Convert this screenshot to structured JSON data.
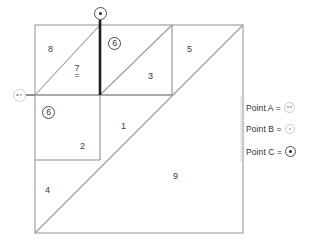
{
  "figure": {
    "colors": {
      "thin_line": "#9a9a9a",
      "mid_line": "#8f8f8f",
      "thick_line": "#1f1f1f",
      "text": "#333333",
      "background": "#ffffff"
    },
    "regions": [
      {
        "id": "r1",
        "label": "1",
        "x": 121,
        "y": 122,
        "circled": false
      },
      {
        "id": "r2",
        "label": "2",
        "x": 80,
        "y": 142,
        "circled": false
      },
      {
        "id": "r3",
        "label": "3",
        "x": 148,
        "y": 72,
        "circled": false
      },
      {
        "id": "r4",
        "label": "4",
        "x": 45,
        "y": 186,
        "circled": false
      },
      {
        "id": "r5",
        "label": "5",
        "x": 187,
        "y": 45,
        "circled": false
      },
      {
        "id": "r6left",
        "label": "6",
        "x": 48,
        "y": 112,
        "circled": true
      },
      {
        "id": "r6top",
        "label": "6",
        "x": 114,
        "y": 43,
        "circled": true
      },
      {
        "id": "r8",
        "label": "8",
        "x": 48,
        "y": 45,
        "circled": false
      },
      {
        "id": "r9",
        "label": "9",
        "x": 173,
        "y": 172,
        "circled": false
      }
    ],
    "region7": {
      "label": "7",
      "equals_mark": "=",
      "x": 76,
      "y": 68
    },
    "points": [
      {
        "id": "pointA",
        "name": "Point A",
        "x": 19,
        "y": 96,
        "symbol": "circle-two-dots",
        "color": "#cfcfcf"
      },
      {
        "id": "pointC",
        "name": "Point C",
        "x": 100,
        "y": 13,
        "symbol": "circle-filled-dot",
        "color": "#4f4f4f"
      }
    ]
  },
  "legend": {
    "items": [
      {
        "id": "legend-a",
        "label": "Point A =",
        "symbol": "circle-two-dots",
        "x": 246,
        "y": 108
      },
      {
        "id": "legend-b",
        "label": "Point B =",
        "symbol": "circle-small-dot",
        "x": 246,
        "y": 128
      },
      {
        "id": "legend-c",
        "label": "Point C =",
        "symbol": "circle-filled-dot",
        "x": 246,
        "y": 150
      }
    ]
  }
}
